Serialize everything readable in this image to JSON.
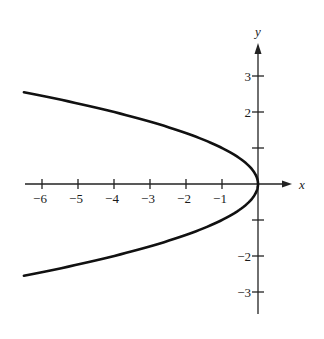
{
  "chart_data": {
    "type": "line",
    "title": "",
    "xlabel": "x",
    "ylabel": "y",
    "equation": "x = -y^2",
    "xlim": [
      -6.5,
      0.9
    ],
    "ylim": [
      -3.5,
      3.9
    ],
    "grid": false,
    "legend": null,
    "x_ticks": [
      -6,
      -5,
      -4,
      -3,
      -2,
      -1
    ],
    "x_tick_labels": [
      "−6",
      "−5",
      "−4",
      "−3",
      "−2",
      "−1"
    ],
    "y_ticks": [
      3,
      2,
      1,
      -1,
      -2,
      -3
    ],
    "y_tick_labels": [
      "3",
      "2",
      "",
      "",
      "−2",
      "−3"
    ],
    "series": [
      {
        "name": "parabola x = -y^2",
        "x": [
          -6.5,
          -5.76,
          -4.84,
          -4.0,
          -3.24,
          -2.56,
          -1.96,
          -1.44,
          -1.0,
          -0.64,
          -0.36,
          -0.16,
          -0.04,
          0.0,
          -0.04,
          -0.16,
          -0.36,
          -0.64,
          -1.0,
          -1.44,
          -1.96,
          -2.56,
          -3.24,
          -4.0,
          -4.84,
          -5.76,
          -6.5
        ],
        "y": [
          2.55,
          2.4,
          2.2,
          2.0,
          1.8,
          1.6,
          1.4,
          1.2,
          1.0,
          0.8,
          0.6,
          0.4,
          0.2,
          0.0,
          -0.2,
          -0.4,
          -0.6,
          -0.8,
          -1.0,
          -1.2,
          -1.4,
          -1.6,
          -1.8,
          -2.0,
          -2.2,
          -2.4,
          -2.55
        ]
      }
    ]
  },
  "axes": {
    "x_name": "x",
    "y_name": "y"
  },
  "colors": {
    "curve": "#111111",
    "axis": "#222222",
    "background": "#ffffff"
  }
}
